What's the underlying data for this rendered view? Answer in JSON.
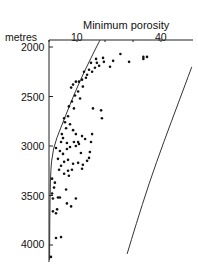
{
  "chart_data": {
    "type": "scatter",
    "title": "Minimum porosity",
    "xlabel": "Minimum porosity",
    "ylabel": "metres",
    "x_axis_position": "top",
    "xlim": [
      0,
      51
    ],
    "ylim": [
      4150,
      1930
    ],
    "y_inverted": true,
    "x_ticks": [
      0,
      10,
      20,
      30,
      40
    ],
    "x_tick_labels": [
      "10",
      "40"
    ],
    "y_ticks": [
      2000,
      2500,
      3000,
      3500,
      4000
    ],
    "y_tick_labels": [
      "2000",
      "2500",
      "3000",
      "3500",
      "4000"
    ],
    "grid": false,
    "legend": null,
    "series": [
      {
        "name": "samples",
        "marker": "dot",
        "points": [
          [
            25.5,
            2070
          ],
          [
            33.7,
            2120
          ],
          [
            33.7,
            2100
          ],
          [
            35.0,
            2100
          ],
          [
            28.6,
            2150
          ],
          [
            22.9,
            2140
          ],
          [
            19.3,
            2110
          ],
          [
            19.6,
            2150
          ],
          [
            21.8,
            2200
          ],
          [
            16.8,
            2120
          ],
          [
            17.1,
            2160
          ],
          [
            17.9,
            2190
          ],
          [
            16.4,
            2210
          ],
          [
            15.0,
            2160
          ],
          [
            15.4,
            2250
          ],
          [
            14.3,
            2230
          ],
          [
            13.6,
            2280
          ],
          [
            12.5,
            2250
          ],
          [
            13.2,
            2310
          ],
          [
            11.8,
            2330
          ],
          [
            10.7,
            2350
          ],
          [
            9.6,
            2350
          ],
          [
            8.6,
            2380
          ],
          [
            7.9,
            2410
          ],
          [
            12.1,
            2400
          ],
          [
            10.4,
            2450
          ],
          [
            9.3,
            2490
          ],
          [
            11.1,
            2520
          ],
          [
            8.2,
            2550
          ],
          [
            7.1,
            2600
          ],
          [
            8.9,
            2620
          ],
          [
            15.7,
            2620
          ],
          [
            18.6,
            2640
          ],
          [
            18.9,
            2720
          ],
          [
            6.8,
            2700
          ],
          [
            5.4,
            2720
          ],
          [
            5.7,
            2760
          ],
          [
            7.5,
            2780
          ],
          [
            6.1,
            2820
          ],
          [
            8.6,
            2840
          ],
          [
            9.6,
            2880
          ],
          [
            4.6,
            2880
          ],
          [
            5.0,
            2920
          ],
          [
            4.3,
            2960
          ],
          [
            6.4,
            2970
          ],
          [
            8.9,
            2960
          ],
          [
            10.4,
            2960
          ],
          [
            11.8,
            2900
          ],
          [
            12.9,
            2930
          ],
          [
            15.0,
            2960
          ],
          [
            15.4,
            2880
          ],
          [
            2.5,
            3020
          ],
          [
            3.9,
            3050
          ],
          [
            5.0,
            3080
          ],
          [
            6.4,
            3030
          ],
          [
            7.5,
            3010
          ],
          [
            9.6,
            3000
          ],
          [
            10.7,
            2980
          ],
          [
            11.4,
            3070
          ],
          [
            14.3,
            3120
          ],
          [
            14.6,
            3060
          ],
          [
            13.6,
            3150
          ],
          [
            3.2,
            3130
          ],
          [
            5.4,
            3160
          ],
          [
            6.8,
            3140
          ],
          [
            8.6,
            3180
          ],
          [
            10.4,
            3170
          ],
          [
            12.1,
            3190
          ],
          [
            11.8,
            3230
          ],
          [
            4.3,
            3200
          ],
          [
            3.6,
            3240
          ],
          [
            6.8,
            3250
          ],
          [
            8.2,
            3240
          ],
          [
            5.4,
            3280
          ],
          [
            7.1,
            3300
          ],
          [
            1.1,
            3330
          ],
          [
            2.1,
            3370
          ],
          [
            1.8,
            3420
          ],
          [
            6.1,
            3440
          ],
          [
            1.1,
            3480
          ],
          [
            1.4,
            3530
          ],
          [
            3.2,
            3520
          ],
          [
            3.9,
            3520
          ],
          [
            6.4,
            3580
          ],
          [
            7.9,
            3610
          ],
          [
            1.4,
            3660
          ],
          [
            2.5,
            3680
          ],
          [
            2.9,
            3640
          ],
          [
            2.5,
            3930
          ],
          [
            4.3,
            3920
          ],
          [
            9.6,
            3530
          ],
          [
            0.7,
            4120
          ]
        ]
      }
    ],
    "curves": [
      {
        "name": "upper envelope",
        "points": [
          [
            18.2,
            1930
          ],
          [
            15.0,
            2110
          ],
          [
            11.4,
            2320
          ],
          [
            7.5,
            2580
          ],
          [
            4.3,
            2810
          ],
          [
            1.4,
            3020
          ],
          [
            0.4,
            3300
          ],
          [
            0.2,
            4150
          ]
        ]
      },
      {
        "name": "theoretical porosity-depth curve",
        "points": [
          [
            51.0,
            2200
          ],
          [
            46.4,
            2550
          ],
          [
            41.1,
            2950
          ],
          [
            35.7,
            3380
          ],
          [
            31.0,
            3800
          ],
          [
            27.9,
            4090
          ]
        ]
      }
    ]
  }
}
